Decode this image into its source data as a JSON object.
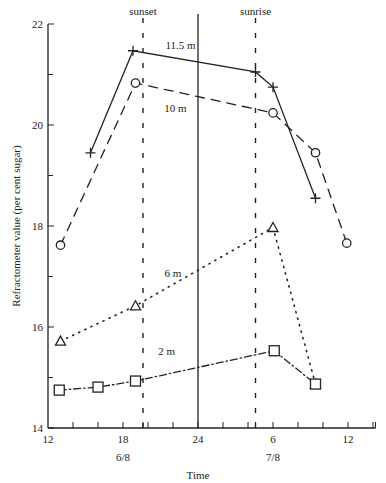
{
  "chart_data": {
    "type": "line",
    "title": "",
    "xlabel": "Time",
    "ylabel": "Refractometer value (per cent sugar)",
    "xlim": [
      12,
      38.2
    ],
    "ylim": [
      14,
      22
    ],
    "x_ticks": [
      {
        "pos": 12,
        "label": "12"
      },
      {
        "pos": 18,
        "label": "18"
      },
      {
        "pos": 24,
        "label": "24"
      },
      {
        "pos": 30,
        "label": "6"
      },
      {
        "pos": 36,
        "label": "12"
      }
    ],
    "x_minor_ticks": [
      14,
      16,
      18,
      19.6,
      20,
      22,
      24,
      26,
      28,
      28.6,
      30,
      32,
      34,
      36,
      38
    ],
    "date_labels": [
      {
        "pos": 18,
        "label": "6/8"
      },
      {
        "pos": 30,
        "label": "7/8"
      }
    ],
    "y_ticks": [
      {
        "pos": 14,
        "label": "14"
      },
      {
        "pos": 16,
        "label": "16"
      },
      {
        "pos": 18,
        "label": "18"
      },
      {
        "pos": 20,
        "label": "20"
      },
      {
        "pos": 22,
        "label": "22"
      }
    ],
    "y_minor_ticks": [
      15,
      17,
      19,
      21
    ],
    "reference_lines": [
      {
        "x": 19.6,
        "label": "sunset",
        "style": "dashed"
      },
      {
        "x": 24,
        "label": "",
        "style": "solid"
      },
      {
        "x": 28.6,
        "label": "sunrise",
        "style": "dashed"
      }
    ],
    "series": [
      {
        "name": "11.5 m",
        "marker": "plus",
        "line": "solid",
        "label_pos": {
          "x": 22.6,
          "y": 21.5
        },
        "x": [
          15.4,
          18.8,
          28.6,
          30.0,
          33.4
        ],
        "y": [
          19.45,
          21.47,
          21.05,
          20.75,
          18.55
        ]
      },
      {
        "name": "10 m",
        "marker": "circle",
        "line": "dashed",
        "label_pos": {
          "x": 22.2,
          "y": 20.25
        },
        "x": [
          13.0,
          19.0,
          30.0,
          33.4,
          35.9
        ],
        "y": [
          17.62,
          20.83,
          20.24,
          19.45,
          17.66
        ]
      },
      {
        "name": "6 m",
        "marker": "triangle",
        "line": "dotted",
        "label_pos": {
          "x": 22.0,
          "y": 17.0
        },
        "x": [
          13.0,
          19.0,
          30.0,
          33.4
        ],
        "y": [
          15.72,
          16.42,
          17.97,
          14.87
        ]
      },
      {
        "name": "2 m",
        "marker": "square",
        "line": "dashdot",
        "label_pos": {
          "x": 21.5,
          "y": 15.45
        },
        "x": [
          12.9,
          16.0,
          19.0,
          30.1,
          33.4
        ],
        "y": [
          14.75,
          14.81,
          14.93,
          15.53,
          14.87
        ]
      }
    ]
  }
}
